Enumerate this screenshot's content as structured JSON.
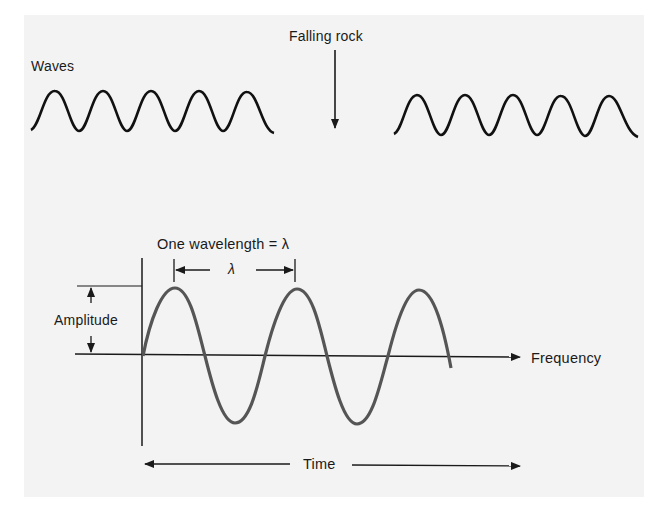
{
  "top_illustration": {
    "waves_label": "Waves",
    "falling_rock_label": "Falling rock",
    "left_wave_cycles": 5,
    "right_wave_cycles": 5
  },
  "main_diagram": {
    "wavelength_title": "One wavelength = λ",
    "lambda_symbol": "λ",
    "amplitude_label": "Amplitude",
    "frequency_label": "Frequency",
    "time_label": "Time",
    "wave_color": "#555555",
    "line_color": "#1a1a1a"
  }
}
